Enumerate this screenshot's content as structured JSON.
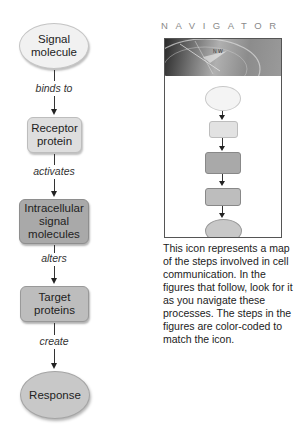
{
  "flowchart": {
    "nodes": [
      {
        "id": "signal-molecule",
        "shape": "ellipse",
        "label_line1": "Signal",
        "label_line2": "molecule",
        "fill": "#f1f1f1"
      },
      {
        "id": "receptor-protein",
        "shape": "rounded-rect",
        "label_line1": "Receptor",
        "label_line2": "protein",
        "fill": "#dedede"
      },
      {
        "id": "intracellular-signal-molecules",
        "shape": "rounded-rect",
        "label_line1": "Intracellular",
        "label_line2": "signal",
        "label_line3": "molecules",
        "fill": "#a9a9a9"
      },
      {
        "id": "target-proteins",
        "shape": "rounded-rect",
        "label_line1": "Target",
        "label_line2": "proteins",
        "fill": "#bdbdbd"
      },
      {
        "id": "response",
        "shape": "ellipse",
        "label_line1": "Response",
        "fill": "#c8c8c8"
      }
    ],
    "edges": [
      {
        "from": "signal-molecule",
        "to": "receptor-protein",
        "label": "binds to"
      },
      {
        "from": "receptor-protein",
        "to": "intracellular-signal-molecules",
        "label": "activates"
      },
      {
        "from": "intracellular-signal-molecules",
        "to": "target-proteins",
        "label": "alters"
      },
      {
        "from": "target-proteins",
        "to": "response",
        "label": "create"
      }
    ]
  },
  "navigator": {
    "title": "NAVIGATOR",
    "image_desc": "compass-photo",
    "caption": "This icon represents a map of the steps involved in cell communication. In the figures that follow, look for it as you navigate these processes. The steps in the figures are color-coded to match the icon."
  }
}
